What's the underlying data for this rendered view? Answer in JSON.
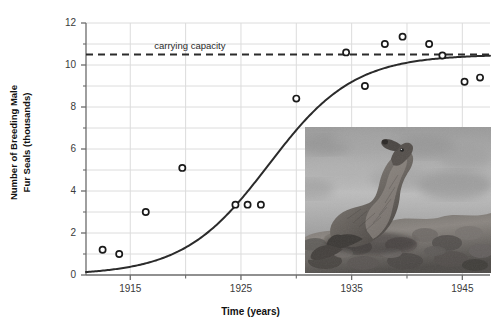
{
  "figure": {
    "clipped_title": "Population growth of fur seals",
    "background_color": "#ffffff"
  },
  "chart_data": {
    "type": "scatter",
    "title": "",
    "xlabel": "Time (years)",
    "ylabel": "Number of Breeding Male Fur Seals (thousands)",
    "xlim": [
      1911,
      1947.5
    ],
    "ylim": [
      0,
      12
    ],
    "xticks": [
      1915,
      1925,
      1935,
      1945
    ],
    "xticks_minor": [
      1920,
      1930,
      1940
    ],
    "yticks": [
      0,
      2,
      4,
      6,
      8,
      10,
      12
    ],
    "yticks_minor": [
      1,
      3,
      5,
      7,
      9,
      11
    ],
    "grid": true,
    "legend": "none",
    "marker": "open-circle",
    "point_color": "#1a1a1a",
    "curve_color": "#2b2b2b",
    "grid_color": "#dcdcdc",
    "axis_color": "#6b6b6b",
    "points": [
      {
        "x": 1912.5,
        "y": 1.2
      },
      {
        "x": 1914.0,
        "y": 1.0
      },
      {
        "x": 1916.4,
        "y": 3.0
      },
      {
        "x": 1919.7,
        "y": 5.1
      },
      {
        "x": 1924.5,
        "y": 3.35
      },
      {
        "x": 1925.6,
        "y": 3.35
      },
      {
        "x": 1926.8,
        "y": 3.35
      },
      {
        "x": 1930.0,
        "y": 8.4
      },
      {
        "x": 1934.5,
        "y": 10.6
      },
      {
        "x": 1936.2,
        "y": 9.0
      },
      {
        "x": 1938.0,
        "y": 11.0
      },
      {
        "x": 1939.6,
        "y": 11.35
      },
      {
        "x": 1942.0,
        "y": 11.0
      },
      {
        "x": 1943.2,
        "y": 10.45
      },
      {
        "x": 1945.2,
        "y": 9.2
      },
      {
        "x": 1946.6,
        "y": 9.4
      }
    ],
    "fitted_curve": {
      "name": "logistic growth curve",
      "model": "logistic",
      "carrying_capacity": 10.5,
      "midpoint_year": 1927.5,
      "rate": 0.26,
      "initial_value": 1.05
    },
    "annotations": [
      {
        "text": "carrying capacity",
        "type": "reference-line-label",
        "x": 1921.5,
        "y": 10.5
      }
    ],
    "reference_lines": [
      {
        "label": "carrying capacity",
        "orientation": "horizontal",
        "value": 10.5,
        "style": "dashed",
        "color": "#2b2b2b"
      }
    ]
  },
  "inset": {
    "name": "fur-seal-photograph",
    "caption": "",
    "description": "Black and white photograph of a male fur seal resting on rocks"
  },
  "axis_labels": {
    "x": "Time (years)",
    "y_line1": "Number of Breeding Male",
    "y_line2": "Fur Seals (thousands)"
  }
}
